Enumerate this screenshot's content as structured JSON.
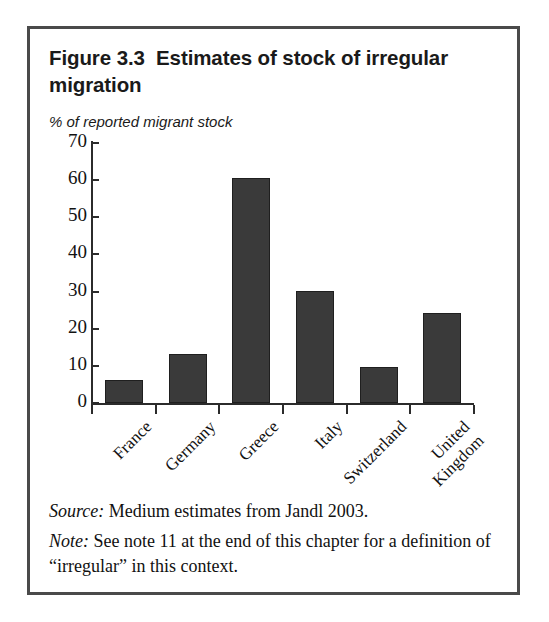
{
  "figure": {
    "title_prefix": "Figure 3.3",
    "title_gap": "  ",
    "title_rest": "Estimates of stock of irregular migration",
    "subtitle": "% of reported migrant stock",
    "source_label": "Source:",
    "source_text": " Medium estimates from Jandl 2003.",
    "note_label": "Note:",
    "note_text": " See note 11 at the end of this chapter for a definition of “irregular” in this context."
  },
  "colors": {
    "bar_fill": "#3a3a3a",
    "bar_border": "#1f1f1f",
    "axis": "#2b2b2b",
    "frame": "#4a4a4a",
    "background": "#ffffff",
    "text": "#111111"
  },
  "chart_data": {
    "type": "bar",
    "title": "Figure 3.3  Estimates of stock of irregular migration",
    "subtitle": "% of reported migrant stock",
    "xlabel": "",
    "ylabel": "% of reported migrant stock",
    "ylim": [
      0,
      70
    ],
    "yticks": [
      0,
      10,
      20,
      30,
      40,
      50,
      60,
      70
    ],
    "grid": false,
    "legend": false,
    "categories": [
      "France",
      "Germany",
      "Greece",
      "Italy",
      "Switzerland",
      "United Kingdom"
    ],
    "category_labels_multiline": [
      [
        "France"
      ],
      [
        "Germany"
      ],
      [
        "Greece"
      ],
      [
        "Italy"
      ],
      [
        "Switzerland"
      ],
      [
        "United",
        "Kingdom"
      ]
    ],
    "values": [
      6.1,
      13.3,
      60.5,
      30.2,
      9.6,
      24.2
    ],
    "units": "percent"
  }
}
